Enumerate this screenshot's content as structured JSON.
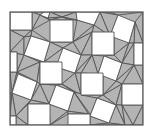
{
  "figure": {
    "title": "",
    "colors": {
      "triangle_fill": "#b4b4b4",
      "square_fill": "#ffffff",
      "edge": "#555555",
      "background": "#ffffff"
    },
    "frame": {
      "x": 10,
      "y": 12,
      "width": 133,
      "height": 113
    },
    "squares": [
      "10,12 32,12 32,30 10,30",
      "50,20 73,20 73,42 50,42",
      "76,12 100,12 94,25 77,20",
      "118,15 135,22 129,43 110,36",
      "92,32 114,32 114,55 92,55",
      "31,36 50,42 44,62 24,55",
      "63,48 81,55 75,73 56,67",
      "134,43 143,43 143,65 134,65",
      "10,52 17,52 17,72 10,72",
      "40,62 62,62 62,84 40,84",
      "104,56 122,63 116,81 98,74",
      "81,73 103,73 103,95 81,95",
      "18,74 37,82 31,100 12,93",
      "122,84 143,84 143,105 122,105",
      "56,85 74,92 68,111 49,104",
      "28,104 50,104 50,125 28,125",
      "97,98 116,105 109,123 90,116",
      "68,114 90,114 90,125 68,125",
      "10,116 16,116 16,125 10,125",
      "44,12 50,12 48,18 40,15"
    ],
    "triangles": [
      "32,12 44,12 40,15",
      "32,12 40,15 32,30",
      "40,15 50,20 32,30",
      "40,15 48,18 50,20",
      "50,12 76,12 62,17",
      "48,18 50,12 62,17",
      "48,18 62,17 50,20",
      "62,17 73,20 50,20",
      "62,17 76,12 77,20",
      "62,17 77,20 73,20",
      "100,12 118,15 110,12",
      "100,12 118,15 110,36",
      "94,25 100,12 110,36",
      "77,20 94,25 73,42",
      "94,25 110,36 92,32",
      "73,42 94,25 92,32",
      "118,15 143,12 143,43",
      "135,22 143,12 143,43",
      "135,22 143,43 134,43",
      "129,43 135,22 134,43",
      "10,30 32,30 24,37",
      "10,30 24,37 10,52",
      "32,30 31,36 24,37",
      "32,30 50,42 31,36",
      "24,37 24,55 10,52",
      "24,37 31,36 24,55",
      "50,42 73,42 63,48",
      "50,42 63,48 44,62",
      "73,42 92,32 81,55",
      "73,42 81,55 63,48",
      "92,32 92,55 81,55",
      "114,32 110,36 129,43",
      "114,32 129,43 114,55",
      "114,55 129,43 122,63",
      "129,43 134,43 122,63",
      "134,43 134,65 122,63",
      "10,52 24,55 17,72",
      "10,52 17,52 17,72",
      "24,55 44,62 40,62",
      "24,55 40,62 17,72",
      "17,72 40,62 37,82",
      "40,62 40,84 37,82",
      "62,62 63,48 56,67",
      "44,62 63,48 62,62",
      "62,62 56,67 62,84",
      "56,67 75,73 62,84",
      "81,55 92,55 75,73",
      "92,55 104,56 98,74",
      "92,55 98,74 81,73",
      "75,73 92,55 81,73",
      "114,55 104,56 122,63",
      "122,63 134,65 116,81",
      "134,65 143,65 143,84",
      "134,65 143,84 122,84",
      "134,65 122,84 116,81",
      "116,81 122,84 103,95",
      "98,74 116,81 103,73",
      "103,73 116,81 103,95",
      "10,72 17,72 12,93",
      "17,72 18,74 12,93",
      "17,72 37,82 18,74",
      "10,93 12,93 10,116",
      "12,93 31,100 16,116",
      "12,93 16,116 10,116",
      "37,82 40,84 31,100",
      "40,84 56,85 49,104",
      "40,84 49,104 31,100",
      "62,84 74,92 56,85",
      "40,84 62,84 56,85",
      "62,84 81,95 74,92",
      "75,73 81,73 81,95",
      "62,84 75,73 81,95",
      "31,100 49,104 28,104",
      "31,100 28,104 16,116",
      "16,116 28,104 28,125",
      "16,116 28,125 16,125",
      "49,104 50,104 50,125",
      "49,104 68,111 50,125",
      "68,111 68,114 50,125",
      "68,111 90,114 68,114",
      "68,111 74,92 90,114",
      "74,92 81,95 97,98",
      "74,92 97,98 90,116",
      "74,92 90,116 90,114",
      "81,95 103,95 97,98",
      "103,95 122,84 116,105",
      "103,95 116,105 97,98",
      "122,84 122,105 116,105",
      "116,105 122,105 125,125",
      "116,105 125,125 109,123",
      "122,105 143,105 133,125",
      "122,105 133,125 125,125",
      "133,125 143,105 143,125",
      "90,116 109,123 90,125",
      "109,123 125,125 90,125"
    ]
  }
}
